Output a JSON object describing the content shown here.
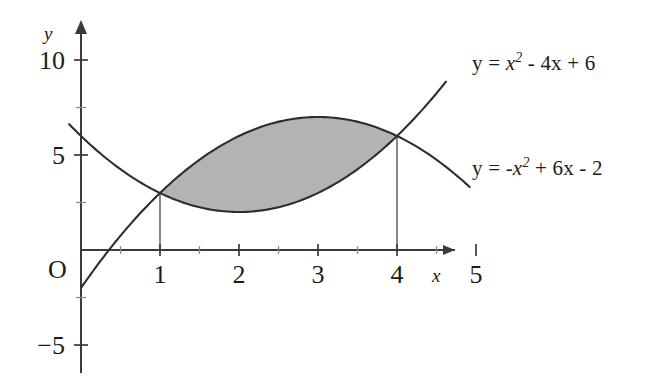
{
  "figure": {
    "kind": "area-between-curves-diagram",
    "background_color": "#ffffff",
    "curve_color": "#2e2e2e",
    "shade_color": "#b3b3b3",
    "axis_color": "#3a3a3a"
  },
  "labels": {
    "y_axis_name": "y",
    "x_axis_name": "x",
    "origin": "O",
    "y_ticks": [
      "10",
      "5",
      "-5"
    ],
    "x_ticks": [
      "1",
      "2",
      "3",
      "4",
      "5"
    ]
  },
  "annotations": {
    "upper_curve_equation": "y = x2 - 4x + 6",
    "lower_curve_equation": "y = -x2 + 6x - 2",
    "upper_eq_parts": {
      "lhs": "y = ",
      "base": "x",
      "exp": "2",
      "rest": " - 4x + 6"
    },
    "lower_eq_parts": {
      "lhs": "y = -",
      "base": "x",
      "exp": "2",
      "rest": " + 6x - 2"
    }
  },
  "chart_data": {
    "type": "line",
    "title": "",
    "xlabel": "x",
    "ylabel": "y",
    "xlim": [
      0,
      5
    ],
    "ylim": [
      -5,
      11
    ],
    "grid": false,
    "legend": "inline-curve-labels",
    "x_ticks_major": [
      1,
      2,
      3,
      4,
      5
    ],
    "x_ticks_minor": [
      0.5,
      1.5,
      2.5,
      3.5,
      4.5
    ],
    "y_ticks_major": [
      -5,
      0,
      5,
      10
    ],
    "y_ticks_minor": [
      -2.5,
      2.5,
      7.5
    ],
    "series": [
      {
        "name": "y = x^2 - 4x + 6",
        "formula": "x^2 - 4*x + 6",
        "domain": [
          -0.15,
          4.62
        ],
        "points": [
          {
            "x": 0,
            "y": 6
          },
          {
            "x": 0.5,
            "y": 4.25
          },
          {
            "x": 1,
            "y": 3
          },
          {
            "x": 1.5,
            "y": 2.25
          },
          {
            "x": 2,
            "y": 2
          },
          {
            "x": 2.5,
            "y": 2.25
          },
          {
            "x": 3,
            "y": 3
          },
          {
            "x": 3.5,
            "y": 4.25
          },
          {
            "x": 4,
            "y": 6
          },
          {
            "x": 4.5,
            "y": 8.25
          },
          {
            "x": 4.62,
            "y": 8.86
          }
        ]
      },
      {
        "name": "y = -x^2 + 6x - 2",
        "formula": "-x^2 + 6*x - 2",
        "domain": [
          0,
          4.92
        ],
        "points": [
          {
            "x": 0,
            "y": -2
          },
          {
            "x": 0.5,
            "y": 0.75
          },
          {
            "x": 1,
            "y": 3
          },
          {
            "x": 1.5,
            "y": 4.75
          },
          {
            "x": 2,
            "y": 6
          },
          {
            "x": 2.5,
            "y": 6.75
          },
          {
            "x": 3,
            "y": 7
          },
          {
            "x": 3.5,
            "y": 6.75
          },
          {
            "x": 4,
            "y": 6
          },
          {
            "x": 4.5,
            "y": 4.75
          },
          {
            "x": 4.92,
            "y": 3.31
          }
        ]
      }
    ],
    "intersections": [
      {
        "x": 1,
        "y": 3
      },
      {
        "x": 4,
        "y": 6
      }
    ],
    "shaded_region": {
      "between": [
        "y = -x^2 + 6x - 2",
        "y = x^2 - 4x + 6"
      ],
      "x_from": 1,
      "x_to": 4,
      "fill": "#b3b3b3"
    },
    "drop_lines": [
      {
        "x": 1,
        "from_y": 0,
        "to_y": 3
      },
      {
        "x": 4,
        "from_y": 0,
        "to_y": 6
      }
    ]
  }
}
